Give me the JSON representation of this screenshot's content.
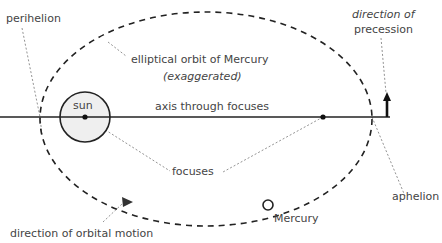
{
  "labels": {
    "perihelion": "perihelion",
    "orbit_line1": "elliptical orbit of Mercury",
    "orbit_line2": "(exaggerated)",
    "precession_line1": "direction of",
    "precession_line2": "precession",
    "sun": "sun",
    "axis": "axis through focuses",
    "focuses": "focuses",
    "aphelion": "aphelion",
    "orbital_motion": "direction of orbital motion",
    "mercury": "Mercury"
  },
  "colors": {
    "stroke": "#222222",
    "leader": "#777777",
    "sun_fill": "#efefef",
    "text": "#444444"
  }
}
